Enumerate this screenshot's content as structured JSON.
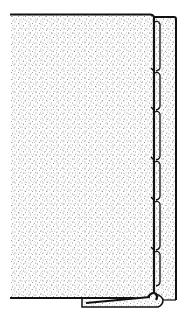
{
  "diagram": {
    "title": "Stippled panel section with segmented hinged edge",
    "colors": {
      "background": "#ffffff",
      "ink": "#111111",
      "stipple": "#2a2a2a"
    },
    "panel": {
      "x": 10,
      "y": 14,
      "right": 153,
      "bottom": 298
    },
    "edge_strip": {
      "x_inner": 156,
      "x_outer": 176,
      "top": 17,
      "bottom": 300
    },
    "segment_joints_y": [
      20,
      71,
      110,
      160,
      200,
      250,
      284
    ],
    "base_flap": {
      "x_start": 82,
      "x_end": 162,
      "y_top": 298,
      "y_bottom": 307
    }
  }
}
